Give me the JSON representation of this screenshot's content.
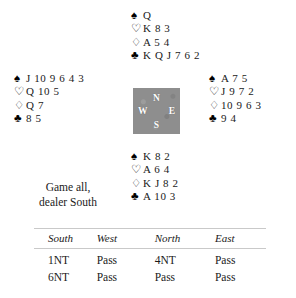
{
  "deal": {
    "north": {
      "label": "North",
      "suits": [
        {
          "pip": "spade",
          "glyph": "♠",
          "cards": "Q"
        },
        {
          "pip": "heart",
          "glyph": "♡",
          "cards": "K 8 3"
        },
        {
          "pip": "diamond",
          "glyph": "♢",
          "cards": "A 5 4"
        },
        {
          "pip": "club",
          "glyph": "♣",
          "cards": "K Q J 7 6 2"
        }
      ]
    },
    "west": {
      "label": "West",
      "suits": [
        {
          "pip": "spade",
          "glyph": "♠",
          "cards": "J 10 9 6 4 3"
        },
        {
          "pip": "heart",
          "glyph": "♡",
          "cards": "Q 10 5"
        },
        {
          "pip": "diamond",
          "glyph": "♢",
          "cards": "Q 7"
        },
        {
          "pip": "club",
          "glyph": "♣",
          "cards": "8 5"
        }
      ]
    },
    "east": {
      "label": "East",
      "suits": [
        {
          "pip": "spade",
          "glyph": "♠",
          "cards": "A 7 5"
        },
        {
          "pip": "heart",
          "glyph": "♡",
          "cards": "J 9 7 2"
        },
        {
          "pip": "diamond",
          "glyph": "♢",
          "cards": "10 9 6 3"
        },
        {
          "pip": "club",
          "glyph": "♣",
          "cards": "9 4"
        }
      ]
    },
    "south": {
      "label": "South",
      "suits": [
        {
          "pip": "spade",
          "glyph": "♠",
          "cards": "K 8 2"
        },
        {
          "pip": "heart",
          "glyph": "♡",
          "cards": "A 6 4"
        },
        {
          "pip": "diamond",
          "glyph": "♢",
          "cards": "K J 8 2"
        },
        {
          "pip": "club",
          "glyph": "♣",
          "cards": "A 10 3"
        }
      ]
    }
  },
  "compass": {
    "north": "N",
    "west": "W",
    "east": "E",
    "south": "S",
    "box_color": "#8e8e8e",
    "letter_color": "#ffffff"
  },
  "conditions": {
    "line1": "Game all,",
    "line2": "dealer South"
  },
  "auction": {
    "headers": [
      "South",
      "West",
      "North",
      "East"
    ],
    "rows": [
      [
        "1NT",
        "Pass",
        "4NT",
        "Pass"
      ],
      [
        "6NT",
        "Pass",
        "Pass",
        "Pass"
      ]
    ]
  }
}
